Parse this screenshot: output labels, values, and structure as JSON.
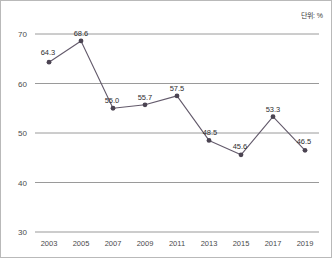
{
  "unit_note": "단위: %",
  "chart_data": {
    "type": "line",
    "title": "",
    "subtitle": "",
    "xlabel": "",
    "ylabel": "",
    "categories": [
      "2003",
      "2005",
      "2007",
      "2009",
      "2011",
      "2013",
      "2015",
      "2017",
      "2019"
    ],
    "values": [
      64.3,
      68.6,
      55.0,
      55.7,
      57.5,
      48.5,
      45.6,
      53.3,
      46.5
    ],
    "data_labels": [
      "64.3",
      "68.6",
      "55.0",
      "55.7",
      "57.5",
      "48.5",
      "45.6",
      "53.3",
      "46.5"
    ],
    "ylim": [
      30,
      70
    ],
    "yticks": [
      30,
      40,
      50,
      60,
      70
    ],
    "ytick_labels": [
      "30",
      "40",
      "50",
      "60",
      "70"
    ],
    "grid": true,
    "legend": false,
    "legend_position": "none",
    "unit": "%",
    "series": [
      {
        "name": "",
        "values": [
          64.3,
          68.6,
          55.0,
          55.7,
          57.5,
          48.5,
          45.6,
          53.3,
          46.5
        ],
        "color": "#635a6b",
        "marker": "circle"
      }
    ],
    "colors": {
      "line": "#635a6b",
      "marker": "#4b4452",
      "grid": "#9a9a9a",
      "frame": "#b9b9b9",
      "text": "#3a3a3a"
    }
  }
}
